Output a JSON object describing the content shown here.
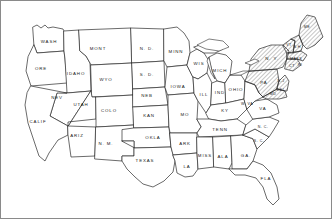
{
  "map": {
    "title": "United States Outline Map",
    "style": "hand-drawn line map, black on white, diagonal hatching on northeastern states",
    "frame_color": "#8a8a8a",
    "line_color": "#2b2b2b",
    "background_color": "#ffffff",
    "label_color": "#1a1a1a",
    "width": 332,
    "height": 219
  },
  "states": [
    {
      "id": "wash",
      "label": "WASH",
      "x": 48,
      "y": 41
    },
    {
      "id": "ore",
      "label": "ORE",
      "x": 40,
      "y": 68
    },
    {
      "id": "idaho",
      "label": "IDAHO",
      "x": 75,
      "y": 73
    },
    {
      "id": "mont",
      "label": "MONT",
      "x": 97,
      "y": 48
    },
    {
      "id": "wyo",
      "label": "WYO",
      "x": 105,
      "y": 79
    },
    {
      "id": "nev",
      "label": "NEV",
      "x": 56,
      "y": 97
    },
    {
      "id": "utah",
      "label": "UTAH",
      "x": 80,
      "y": 104
    },
    {
      "id": "colo",
      "label": "COLO",
      "x": 108,
      "y": 110
    },
    {
      "id": "calif",
      "label": "CALIF",
      "x": 37,
      "y": 121
    },
    {
      "id": "ariz",
      "label": "ARIZ",
      "x": 76,
      "y": 135
    },
    {
      "id": "nm",
      "label": "N. M.",
      "x": 105,
      "y": 143
    },
    {
      "id": "nd",
      "label": "N. D.",
      "x": 146,
      "y": 48
    },
    {
      "id": "sd",
      "label": "S. D.",
      "x": 146,
      "y": 74
    },
    {
      "id": "neb",
      "label": "NEB",
      "x": 146,
      "y": 95
    },
    {
      "id": "kan",
      "label": "KAN",
      "x": 148,
      "y": 115
    },
    {
      "id": "okla",
      "label": "OKLA",
      "x": 152,
      "y": 137
    },
    {
      "id": "texas",
      "label": "TEXAS",
      "x": 144,
      "y": 160
    },
    {
      "id": "minn",
      "label": "MINN",
      "x": 175,
      "y": 51
    },
    {
      "id": "iowa",
      "label": "IOWA",
      "x": 177,
      "y": 86
    },
    {
      "id": "mo",
      "label": "MO",
      "x": 184,
      "y": 114
    },
    {
      "id": "ark",
      "label": "ARK",
      "x": 184,
      "y": 143
    },
    {
      "id": "la",
      "label": "LA",
      "x": 186,
      "y": 166
    },
    {
      "id": "wis",
      "label": "WIS",
      "x": 198,
      "y": 63
    },
    {
      "id": "ill",
      "label": "ILL",
      "x": 203,
      "y": 94
    },
    {
      "id": "mich",
      "label": "MICH",
      "x": 219,
      "y": 70
    },
    {
      "id": "ind",
      "label": "IND",
      "x": 219,
      "y": 92
    },
    {
      "id": "ohio",
      "label": "OHIO",
      "x": 235,
      "y": 89
    },
    {
      "id": "ky",
      "label": "KY",
      "x": 224,
      "y": 110
    },
    {
      "id": "tenn",
      "label": "TENN",
      "x": 219,
      "y": 129
    },
    {
      "id": "miss",
      "label": "MISS",
      "x": 204,
      "y": 155
    },
    {
      "id": "ala",
      "label": "ALA",
      "x": 222,
      "y": 156
    },
    {
      "id": "ga",
      "label": "GA.",
      "x": 245,
      "y": 155
    },
    {
      "id": "fla",
      "label": "FLA",
      "x": 265,
      "y": 178
    },
    {
      "id": "sc",
      "label": "S. C.",
      "x": 258,
      "y": 140
    },
    {
      "id": "nc",
      "label": "N. C.",
      "x": 262,
      "y": 126
    },
    {
      "id": "va",
      "label": "VA",
      "x": 262,
      "y": 108
    },
    {
      "id": "wva",
      "label": "W. VA",
      "x": 246,
      "y": 103
    },
    {
      "id": "pa",
      "label": "PA",
      "x": 263,
      "y": 82
    },
    {
      "id": "ny",
      "label": "N. Y.",
      "x": 271,
      "y": 58
    },
    {
      "id": "maine",
      "label": "ME",
      "x": 306,
      "y": 26
    },
    {
      "id": "vt",
      "label": "VT",
      "x": 288,
      "y": 44
    },
    {
      "id": "nh",
      "label": "N.H",
      "x": 296,
      "y": 46
    },
    {
      "id": "mass",
      "label": "MASS",
      "x": 295,
      "y": 58
    },
    {
      "id": "conn",
      "label": "CT",
      "x": 291,
      "y": 65
    },
    {
      "id": "ri",
      "label": "RI",
      "x": 299,
      "y": 64
    },
    {
      "id": "nj",
      "label": "N.J",
      "x": 280,
      "y": 80
    },
    {
      "id": "del",
      "label": "DEL",
      "x": 280,
      "y": 89
    },
    {
      "id": "md",
      "label": "MD",
      "x": 272,
      "y": 93
    }
  ],
  "hatched_states": [
    "ny",
    "pa",
    "vt",
    "nh",
    "mass",
    "conn",
    "ri",
    "nj",
    "del",
    "md",
    "maine"
  ],
  "regions": {
    "west": [
      "wash",
      "ore",
      "calif",
      "nev",
      "idaho",
      "mont",
      "wyo",
      "utah",
      "colo",
      "ariz",
      "nm"
    ],
    "midwest": [
      "nd",
      "sd",
      "neb",
      "kan",
      "minn",
      "iowa",
      "mo",
      "wis",
      "ill",
      "mich",
      "ind",
      "ohio"
    ],
    "south": [
      "okla",
      "texas",
      "ark",
      "la",
      "miss",
      "ala",
      "tenn",
      "ky",
      "ga",
      "fla",
      "sc",
      "nc",
      "va",
      "wva"
    ],
    "northeast": [
      "pa",
      "ny",
      "nj",
      "del",
      "md",
      "conn",
      "ri",
      "mass",
      "vt",
      "nh",
      "maine"
    ]
  }
}
